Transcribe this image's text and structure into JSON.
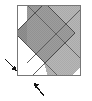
{
  "figure": {
    "title": "Two overlapping rotated squares inscribed in an outer square",
    "type": "geometric-diagram",
    "canvas": {
      "width": 92,
      "height": 101,
      "background": "#ffffff"
    },
    "colors": {
      "outline": "#666666",
      "inner_outline": "#4d4d4d",
      "white_fill": "#ffffff",
      "light_gray_fill": "#b3b3b3",
      "mid_gray_fill": "#a8a8a8",
      "dark_gray_fill": "#8c8c8c",
      "overlap_fill": "#9a9a9a",
      "arrow_color": "#1a1a1a"
    },
    "outer_square": {
      "name": "outer-square",
      "x": 17,
      "y": 5,
      "width": 64,
      "height": 71,
      "stroke": "#777777",
      "stroke_width": 1,
      "fill": "#ffffff"
    },
    "shapes": [
      {
        "name": "light-diamond",
        "label": "upper-right rotated square",
        "points": "27,5 81,5 81,60 53,88",
        "fill": "#b3b3b3",
        "stroke": "#595959"
      },
      {
        "name": "dark-diamond",
        "label": "lower-left rotated square",
        "points": "17,5 45,5 73,33 45,61 17,33",
        "fill": "#8f8f8f",
        "stroke": "#4d4d4d"
      }
    ],
    "arrows": [
      {
        "name": "arrow-left",
        "label": "left edge indicator",
        "direction": "down-right",
        "from": {
          "x": 4,
          "y": 58
        },
        "to": {
          "x": 17,
          "y": 70
        },
        "color": "#141414"
      },
      {
        "name": "arrow-bottom",
        "label": "bottom edge indicator",
        "direction": "up-left",
        "from": {
          "x": 45,
          "y": 97
        },
        "to": {
          "x": 33,
          "y": 80
        },
        "color": "#141414"
      }
    ]
  }
}
